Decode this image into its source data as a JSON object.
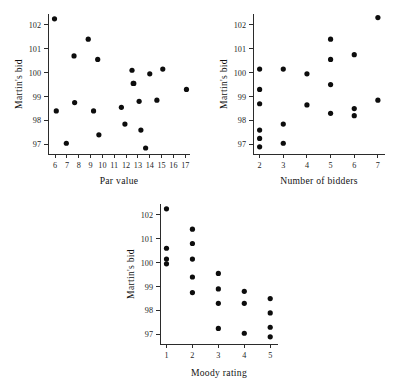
{
  "figure": {
    "background_color": "#ffffff",
    "point_color": "#0d0d0d",
    "axis_color": "#2b2b2b",
    "panel_count": 3
  },
  "chart_data": [
    {
      "type": "scatter",
      "title": "",
      "xlabel": "Par value",
      "ylabel": "Martin's bid",
      "xlim": [
        5.4,
        17.4
      ],
      "ylim": [
        96.6,
        102.45
      ],
      "xticks": [
        6,
        7,
        8,
        9,
        10,
        11,
        12,
        13,
        14,
        15,
        16,
        17
      ],
      "yticks": [
        97,
        98,
        99,
        100,
        101,
        102
      ],
      "xtick_labels": [
        "6",
        "7",
        "8",
        "9",
        "10",
        "11",
        "12",
        "13",
        "14",
        "15",
        "16",
        "17"
      ],
      "ytick_labels": [
        "97",
        "98",
        "99",
        "100",
        "101",
        "102"
      ],
      "grid": false,
      "legend": "none",
      "x": [
        5.95,
        6.1,
        6.95,
        7.6,
        7.65,
        8.8,
        9.25,
        9.6,
        9.7,
        11.6,
        11.9,
        12.5,
        12.6,
        12.65,
        13.1,
        13.25,
        13.65,
        14.0,
        14.6,
        15.1,
        17.1
      ],
      "y": [
        102.25,
        98.4,
        97.05,
        100.7,
        98.75,
        101.4,
        98.4,
        100.55,
        97.4,
        98.55,
        97.85,
        100.1,
        99.55,
        99.55,
        98.8,
        97.6,
        96.85,
        99.95,
        98.85,
        100.15,
        99.3
      ]
    },
    {
      "type": "scatter",
      "title": "",
      "xlabel": "Number of bidders",
      "ylabel": "Martin's bid",
      "xlim": [
        1.72,
        7.3
      ],
      "ylim": [
        96.6,
        102.45
      ],
      "xticks": [
        2,
        3,
        4,
        5,
        6,
        7
      ],
      "yticks": [
        97,
        98,
        99,
        100,
        101,
        102
      ],
      "xtick_labels": [
        "2",
        "3",
        "4",
        "5",
        "6",
        "7"
      ],
      "ytick_labels": [
        "97",
        "98",
        "99",
        "100",
        "101",
        "102"
      ],
      "grid": false,
      "legend": "none",
      "x": [
        2,
        2,
        2,
        2,
        2,
        2,
        3,
        3,
        3,
        4,
        4,
        5,
        5,
        5,
        5,
        6,
        6,
        6,
        7,
        7
      ],
      "y": [
        100.15,
        99.3,
        98.7,
        97.6,
        97.25,
        96.9,
        100.15,
        97.85,
        97.05,
        99.95,
        98.65,
        101.4,
        100.55,
        99.5,
        98.3,
        100.75,
        98.5,
        98.2,
        102.3,
        98.85
      ]
    },
    {
      "type": "scatter",
      "title": "",
      "xlabel": "Moody rating",
      "ylabel": "Martin's bid",
      "xlim": [
        0.75,
        5.3
      ],
      "ylim": [
        96.6,
        102.45
      ],
      "xticks": [
        1,
        2,
        3,
        4,
        5
      ],
      "yticks": [
        97,
        98,
        99,
        100,
        101,
        102
      ],
      "xtick_labels": [
        "1",
        "2",
        "3",
        "4",
        "5"
      ],
      "ytick_labels": [
        "97",
        "98",
        "99",
        "100",
        "101",
        "102"
      ],
      "grid": false,
      "legend": "none",
      "x": [
        1,
        1,
        1,
        1,
        2,
        2,
        2,
        2,
        2,
        3,
        3,
        3,
        3,
        4,
        4,
        4,
        5,
        5,
        5,
        5
      ],
      "y": [
        102.25,
        100.6,
        100.15,
        99.95,
        101.4,
        100.8,
        100.15,
        99.4,
        98.75,
        99.55,
        98.9,
        98.3,
        97.25,
        98.8,
        98.3,
        97.05,
        98.5,
        97.9,
        97.3,
        96.9
      ]
    }
  ]
}
